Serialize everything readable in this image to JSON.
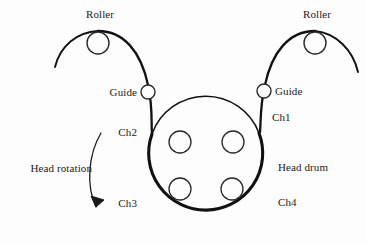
{
  "figure": {
    "background_color": "#fdfdfd",
    "stroke_color": "#111111"
  },
  "labels": {
    "roller_left": "Roller",
    "roller_right": "Roller",
    "guide_left": "Guide",
    "guide_right": "Guide",
    "ch1": "Ch1",
    "ch2": "Ch2",
    "ch3": "Ch3",
    "ch4": "Ch4",
    "head_drum": "Head drum",
    "head_rotation": "Head rotation"
  },
  "components": {
    "head_drum": {
      "name": "head-drum",
      "center_x": 205,
      "center_y": 169,
      "radius": 57
    },
    "heads": [
      {
        "name": "head-upper-left",
        "center_x": 180,
        "center_y": 142,
        "radius": 11
      },
      {
        "name": "head-upper-right",
        "center_x": 233,
        "center_y": 142,
        "radius": 11
      },
      {
        "name": "head-lower-left",
        "center_x": 180,
        "center_y": 189,
        "radius": 11
      },
      {
        "name": "head-lower-right",
        "center_x": 232,
        "center_y": 189,
        "radius": 11
      }
    ],
    "rollers": [
      {
        "name": "roller-left",
        "center_x": 98,
        "center_y": 43,
        "radius": 11
      },
      {
        "name": "roller-right",
        "center_x": 315,
        "center_y": 43,
        "radius": 11
      }
    ],
    "guides": [
      {
        "name": "guide-left",
        "center_x": 148,
        "center_y": 92,
        "radius": 7
      },
      {
        "name": "guide-right",
        "center_x": 264,
        "center_y": 91,
        "radius": 7
      }
    ]
  },
  "channels": [
    {
      "id": "Ch1",
      "position": "upper-right",
      "x": 272,
      "y": 117
    },
    {
      "id": "Ch2",
      "position": "upper-left",
      "x": 137,
      "y": 132
    },
    {
      "id": "Ch3",
      "position": "lower-left",
      "x": 137,
      "y": 203
    },
    {
      "id": "Ch4",
      "position": "lower-right",
      "x": 278,
      "y": 202
    }
  ],
  "rotation": {
    "direction": "counter-clockwise",
    "arrow_label": "Head rotation"
  }
}
